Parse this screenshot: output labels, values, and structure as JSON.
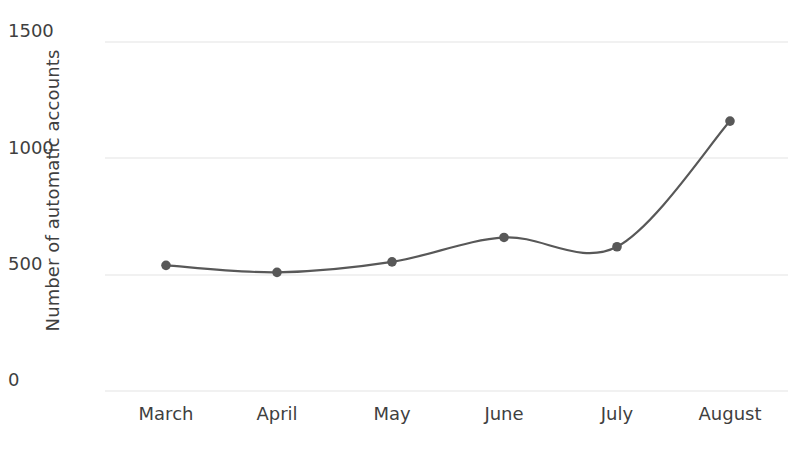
{
  "chart_data": {
    "type": "line",
    "title": "",
    "xlabel": "",
    "ylabel": "Number of automatic accounts",
    "categories": [
      "March",
      "April",
      "May",
      "June",
      "July",
      "August"
    ],
    "values": [
      540,
      510,
      555,
      660,
      620,
      1160
    ],
    "series": [
      {
        "name": "Number of automatic accounts",
        "values": [
          540,
          510,
          555,
          660,
          620,
          1160
        ]
      }
    ],
    "ylim": [
      0,
      1500
    ],
    "yticks": [
      0,
      500,
      1000,
      1500
    ],
    "ytick_labels": [
      "0",
      "500",
      "1000",
      "1500"
    ],
    "grid": "horizontal",
    "legend": "none",
    "markers": "filled-circle",
    "line_color": "#585858",
    "marker_color": "#585858",
    "grid_color": "#ededed",
    "text_color": "#3f3f3f",
    "background": "#ffffff",
    "smoothing": "spline"
  }
}
